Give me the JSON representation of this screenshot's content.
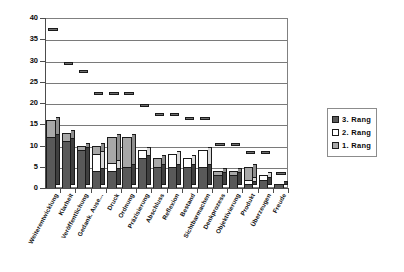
{
  "chart_data": {
    "type": "bar",
    "subtype": "stacked-column-3d",
    "title": "",
    "xlabel": "",
    "ylabel": "",
    "ylim": [
      0,
      40
    ],
    "ytick_step": 5,
    "yticks": [
      "40",
      "35",
      "30",
      "25",
      "20",
      "15",
      "10",
      "5",
      "0"
    ],
    "grid": true,
    "grid_axis": "y",
    "legend_position": "right",
    "categories": [
      "Weiterentwicklung",
      "Klarheit",
      "Veröffentlichung",
      "Gedank. Ause...",
      "Druck",
      "Ordnung",
      "Präzisierung",
      "Abschluss",
      "Reflexion",
      "Bestand",
      "Sichtbarmachen",
      "Denkprozess",
      "Objektivierung",
      "Produkt",
      "Überzeugen",
      "Freude"
    ],
    "series": [
      {
        "name": "1. Rang",
        "color": "#a8a8a8",
        "values": [
          16,
          13,
          10,
          10,
          12,
          12,
          3,
          7,
          4,
          4,
          2,
          4,
          4,
          5,
          3,
          1
        ]
      },
      {
        "name": "2. Rang",
        "color": "#ffffff",
        "values": [
          9,
          5,
          8,
          8,
          6,
          5,
          9,
          5,
          8,
          7,
          9,
          3,
          3,
          2,
          3,
          1
        ]
      },
      {
        "name": "3. Rang",
        "color": "#595959",
        "values": [
          12,
          11,
          9,
          4,
          4,
          5,
          7,
          5,
          5,
          5,
          5,
          3,
          3,
          1,
          2,
          1
        ]
      }
    ],
    "totals": [
      37,
      29,
      27,
      22,
      22,
      22,
      19,
      17,
      17,
      16,
      16,
      10,
      10,
      8,
      8,
      3
    ]
  },
  "legend": {
    "items": [
      {
        "label": "3. Rang",
        "swatch": "#595959"
      },
      {
        "label": "2. Rang",
        "swatch": "#ffffff"
      },
      {
        "label": "1. Rang",
        "swatch": "#a8a8a8"
      }
    ]
  },
  "colors": {
    "series_1_rang": "#a8a8a8",
    "series_2_rang": "#ffffff",
    "series_3_rang": "#595959",
    "gridline": "#7a7a7a",
    "axis": "#4d4d4d",
    "plot_background": "#ffffff"
  }
}
